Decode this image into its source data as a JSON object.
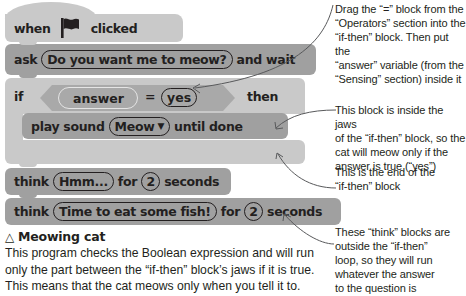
{
  "script": {
    "hat": {
      "when": "when",
      "icon": "green-flag-icon",
      "clicked": "clicked"
    },
    "ask": {
      "label": "ask",
      "question": "Do you want me to meow?",
      "suffix": "and wait"
    },
    "if_block": {
      "if_label": "if",
      "condition": {
        "left": "answer",
        "operator": "=",
        "right": "yes"
      },
      "then_label": "then",
      "inner": {
        "label": "play sound",
        "sound": "Meow",
        "dropdown_icon": "▼",
        "suffix": "until done"
      }
    },
    "think1": {
      "label": "think",
      "text": "Hmm...",
      "for": "for",
      "secs": "2",
      "unit": "seconds"
    },
    "think2": {
      "label": "think",
      "text": "Time to eat some fish!",
      "for": "for",
      "secs": "2",
      "unit": "seconds"
    }
  },
  "annotations": {
    "a1": [
      "Drag the “=” block from the",
      "“Operators” section into the",
      "“if-then” block. Then put the",
      "“answer” variable (from the",
      "“Sensing” section) inside it"
    ],
    "a2": [
      "This block is inside the jaws",
      "of the “if-then” block, so the",
      "cat will meow only if the",
      "answer is true (“yes”)"
    ],
    "a3": [
      "This is the end of the",
      "“if-then” block"
    ],
    "a4": [
      "These “think” blocks are",
      "outside the “if-then”",
      "loop, so they will run",
      "whatever the answer",
      "to the question is"
    ]
  },
  "caption": {
    "icon": "△",
    "title": "Meowing cat",
    "body": "This program checks the Boolean expression and will run only the part between the “if-then” block’s jaws if it is true. This means that the cat meows only when you tell it to."
  },
  "colors": {
    "light_block": "#c9c9c9",
    "dark_block": "#a0a0a0",
    "text": "#231f20",
    "arrow": "#58595b"
  }
}
